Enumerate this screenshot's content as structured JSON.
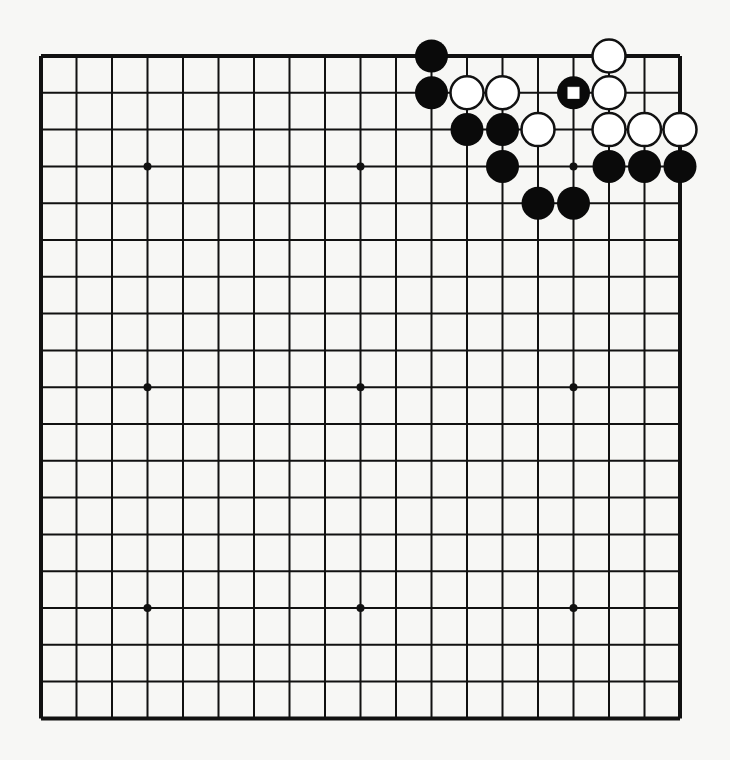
{
  "diagram": {
    "type": "go-board",
    "size": 19,
    "origin": {
      "x": 41,
      "y": 56
    },
    "spacing": {
      "x": 35.5,
      "y": 36.8
    },
    "star_points": [
      [
        4,
        4
      ],
      [
        10,
        4
      ],
      [
        16,
        4
      ],
      [
        4,
        10
      ],
      [
        10,
        10
      ],
      [
        16,
        10
      ],
      [
        4,
        16
      ],
      [
        10,
        16
      ],
      [
        16,
        16
      ]
    ],
    "colors": {
      "line": "#111111",
      "black_stone": "#0a0a0a",
      "white_stone": "#ffffff",
      "background": "#f7f7f5"
    },
    "stones": {
      "black": [
        [
          12,
          1
        ],
        [
          12,
          2
        ],
        [
          13,
          3
        ],
        [
          14,
          3
        ],
        [
          14,
          4
        ],
        [
          15,
          5
        ],
        [
          16,
          5
        ],
        [
          17,
          4
        ],
        [
          18,
          4
        ],
        [
          19,
          4
        ],
        [
          16,
          2
        ]
      ],
      "white": [
        [
          17,
          1
        ],
        [
          13,
          2
        ],
        [
          14,
          2
        ],
        [
          17,
          2
        ],
        [
          15,
          3
        ],
        [
          17,
          3
        ],
        [
          18,
          3
        ],
        [
          19,
          3
        ]
      ]
    },
    "marked": [
      {
        "pos": [
          16,
          2
        ],
        "mark": "square",
        "color": "black"
      }
    ]
  }
}
